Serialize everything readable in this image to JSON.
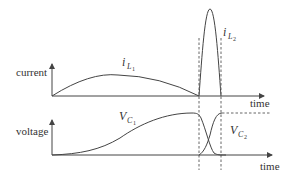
{
  "diagram": {
    "top_panel": {
      "y_label": "current",
      "x_label": "time",
      "curves": [
        {
          "name": "i_L1",
          "symbol": "i",
          "subscript": "L",
          "subsub": "1",
          "shape": "broad arch"
        },
        {
          "name": "i_L2",
          "symbol": "i",
          "subscript": "L",
          "subsub": "2",
          "shape": "narrow tall pulse"
        }
      ]
    },
    "bottom_panel": {
      "y_label": "voltage",
      "x_label": "time",
      "curves": [
        {
          "name": "V_C1",
          "symbol": "V",
          "subscript": "C",
          "subsub": "1",
          "shape": "rises then falls"
        },
        {
          "name": "V_C2",
          "symbol": "V",
          "subscript": "C",
          "subsub": "2",
          "shape": "rises then holds (dashed)"
        }
      ]
    },
    "colors": {
      "line": "#444444",
      "text": "#333333",
      "background": "#ffffff"
    }
  }
}
